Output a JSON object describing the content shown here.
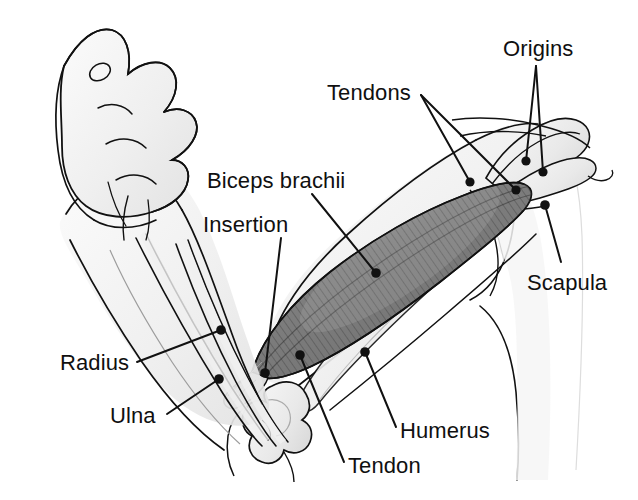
{
  "figure": {
    "kind": "anatomy-illustration",
    "background_color": "#ffffff",
    "line_color": "#111111",
    "muscle_fill_color": "#8a8a8a",
    "muscle_stripe_color": "#4a4a4a",
    "skin_fill_color": "#f2f2f2",
    "bone_fill_color": "#ededed",
    "label_color": "#101010",
    "label_font_size_px": 22,
    "width": 638,
    "height": 500
  },
  "labels": [
    {
      "id": "tendons",
      "text": "Tendons",
      "x": 327,
      "y": 82,
      "anchor": [
        421,
        95
      ],
      "leaders": [
        {
          "to": [
            470,
            182
          ],
          "dot": true
        },
        {
          "to": [
            516,
            190
          ],
          "dot": true
        }
      ]
    },
    {
      "id": "origins",
      "text": "Origins",
      "x": 503,
      "y": 38,
      "anchor": [
        536,
        66
      ],
      "leaders": [
        {
          "to": [
            526,
            161
          ],
          "dot": true
        },
        {
          "to": [
            543,
            172
          ],
          "dot": true
        }
      ]
    },
    {
      "id": "biceps-brachii",
      "text": "Biceps brachii",
      "x": 207,
      "y": 170,
      "anchor": [
        312,
        194
      ],
      "leaders": [
        {
          "to": [
            376,
            273
          ],
          "dot": true
        }
      ]
    },
    {
      "id": "insertion",
      "text": "Insertion",
      "x": 203,
      "y": 214,
      "anchor": [
        281,
        238
      ],
      "leaders": [
        {
          "to": [
            265,
            373
          ],
          "dot": true
        }
      ]
    },
    {
      "id": "scapula",
      "text": "Scapula",
      "x": 527,
      "y": 272,
      "anchor": [
        561,
        270
      ],
      "leaders": [
        {
          "to": [
            545,
            205
          ],
          "dot": true
        }
      ]
    },
    {
      "id": "radius",
      "text": "Radius",
      "x": 60,
      "y": 352,
      "anchor": [
        137,
        362
      ],
      "leaders": [
        {
          "to": [
            221,
            330
          ],
          "dot": true
        }
      ]
    },
    {
      "id": "ulna",
      "text": "Ulna",
      "x": 110,
      "y": 405,
      "anchor": [
        167,
        414
      ],
      "leaders": [
        {
          "to": [
            219,
            379
          ],
          "dot": true
        }
      ]
    },
    {
      "id": "humerus",
      "text": "Humerus",
      "x": 400,
      "y": 420,
      "anchor": [
        396,
        427
      ],
      "leaders": [
        {
          "to": [
            365,
            352
          ],
          "dot": true
        }
      ]
    },
    {
      "id": "tendon",
      "text": "Tendon",
      "x": 348,
      "y": 455,
      "anchor": [
        344,
        462
      ],
      "leaders": [
        {
          "to": [
            300,
            355
          ],
          "dot": true
        }
      ]
    }
  ],
  "structures": [
    {
      "id": "fist",
      "name": "Closed fist"
    },
    {
      "id": "forearm",
      "name": "Forearm"
    },
    {
      "id": "radius-bone",
      "name": "Radius bone"
    },
    {
      "id": "ulna-bone",
      "name": "Ulna bone"
    },
    {
      "id": "elbow",
      "name": "Elbow joint / humeral condyles"
    },
    {
      "id": "humerus-bone",
      "name": "Humerus bone"
    },
    {
      "id": "biceps-muscle",
      "name": "Biceps brachii muscle belly"
    },
    {
      "id": "distal-tendon",
      "name": "Distal biceps tendon"
    },
    {
      "id": "proximal-tendons",
      "name": "Proximal biceps tendons (long and short head)"
    },
    {
      "id": "scapula-bone",
      "name": "Scapula"
    },
    {
      "id": "clavicle-bone",
      "name": "Clavicle"
    },
    {
      "id": "torso",
      "name": "Torso / shoulder outline"
    }
  ]
}
